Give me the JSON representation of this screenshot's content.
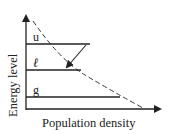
{
  "diagram": {
    "y_axis_label": "Energy level",
    "x_axis_label": "Population density",
    "levels": [
      {
        "name": "u",
        "label": "u"
      },
      {
        "name": "l",
        "label": "ℓ"
      },
      {
        "name": "g",
        "label": "g"
      }
    ],
    "curve": "dashed decreasing (Boltzmann) distribution",
    "transition": "u → ℓ",
    "colors": {
      "stroke": "#222222",
      "background": "#ffffff"
    }
  }
}
